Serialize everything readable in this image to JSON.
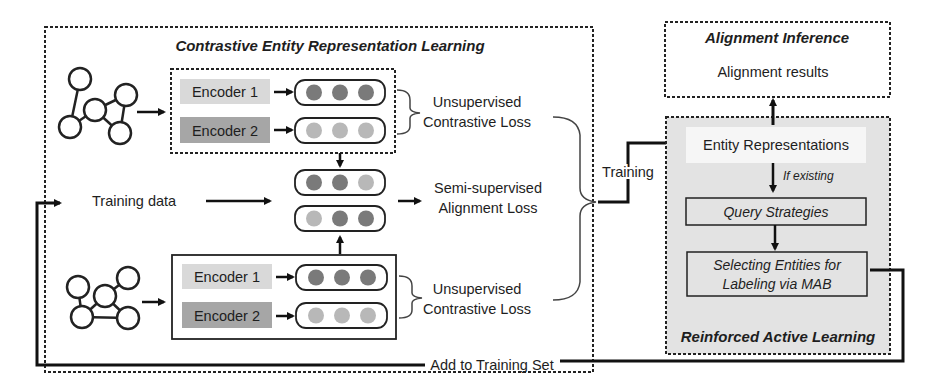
{
  "colors": {
    "dark_node": "#7a7a7a",
    "light_node": "#b8b8b8",
    "encoder1_bg": "#d9d9d9",
    "encoder2_bg": "#a6a6a6",
    "ral_bg": "#e3e3e3",
    "line": "#111111"
  },
  "cerl": {
    "title": "Contrastive Entity Representation Learning",
    "top_group": {
      "encoder1": "Encoder 1",
      "encoder2": "Encoder 2",
      "loss_line1": "Unsupervised",
      "loss_line2": "Contrastive Loss"
    },
    "bottom_group": {
      "encoder1": "Encoder 1",
      "encoder2": "Encoder 2",
      "loss_line1": "Unsupervised",
      "loss_line2": "Contrastive Loss"
    },
    "training_data": "Training data",
    "semi_line1": "Semi-supervised",
    "semi_line2": "Alignment Loss"
  },
  "training_label": "Training",
  "alignment_inference": {
    "title": "Alignment Inference",
    "results": "Alignment results"
  },
  "ral": {
    "title": "Reinforced Active Learning",
    "entity_representations": "Entity Representations",
    "if_existing": "If existing",
    "query_strategies": "Query Strategies",
    "selecting_line1": "Selecting Entities for",
    "selecting_line2": "Labeling via MAB"
  },
  "feedback_label": "Add to Training Set"
}
